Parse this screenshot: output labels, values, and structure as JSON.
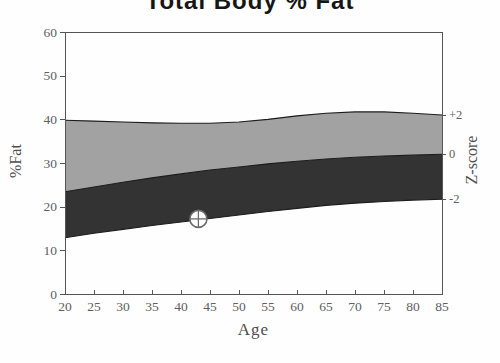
{
  "title": "Total Body % Fat",
  "colors": {
    "band_light": "#a2a2a2",
    "band_dark": "#333333",
    "curve_line": "#1c1c1c",
    "axis_line": "#555555",
    "tick_text": "#606060",
    "marker_stroke": "#6b6b6b",
    "marker_fill": "#ffffff",
    "background": "#fefefe"
  },
  "chart_data": {
    "type": "area",
    "title": "Total Body % Fat",
    "xlabel": "Age",
    "ylabel_left": "%Fat",
    "ylabel_right": "Z-score",
    "xlim": [
      20,
      85
    ],
    "ylim": [
      0,
      60
    ],
    "x_ticks": [
      20,
      25,
      30,
      35,
      40,
      45,
      50,
      55,
      60,
      65,
      70,
      75,
      80,
      85
    ],
    "y_ticks": [
      0,
      10,
      20,
      30,
      40,
      50,
      60
    ],
    "grid": false,
    "legend": "none",
    "x": [
      20,
      25,
      30,
      35,
      40,
      45,
      50,
      55,
      60,
      65,
      70,
      75,
      80,
      85
    ],
    "series": [
      {
        "name": "z_plus2",
        "label": "+2",
        "values": [
          39.8,
          39.6,
          39.4,
          39.2,
          39.1,
          39.1,
          39.4,
          40.0,
          40.8,
          41.4,
          41.7,
          41.7,
          41.4,
          41.0
        ]
      },
      {
        "name": "z_0",
        "label": "0",
        "values": [
          23.4,
          24.5,
          25.6,
          26.6,
          27.5,
          28.4,
          29.1,
          29.8,
          30.4,
          30.9,
          31.3,
          31.6,
          31.8,
          32.0
        ]
      },
      {
        "name": "z_minus2",
        "label": "-2",
        "values": [
          12.9,
          13.9,
          14.8,
          15.7,
          16.5,
          17.3,
          18.1,
          18.9,
          19.6,
          20.3,
          20.8,
          21.2,
          21.5,
          21.7
        ]
      }
    ],
    "bands": [
      {
        "name": "upper-band",
        "lower_series": "z_0",
        "upper_series": "z_plus2",
        "color_key": "band_light"
      },
      {
        "name": "lower-band",
        "lower_series": "z_minus2",
        "upper_series": "z_0",
        "color_key": "band_dark"
      }
    ],
    "right_axis_labels": [
      {
        "text": "+2",
        "series": "z_plus2"
      },
      {
        "text": "0",
        "series": "z_0"
      },
      {
        "text": "-2",
        "series": "z_minus2"
      }
    ],
    "patient_point": {
      "age": 43,
      "fat": 17.2
    }
  }
}
